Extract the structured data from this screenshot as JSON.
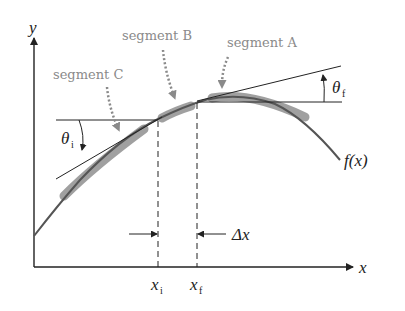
{
  "diagram": {
    "axes": {
      "x_label": "x",
      "y_label": "y"
    },
    "function_label": "f(x)",
    "segments": [
      {
        "id": "A",
        "label": "segment A"
      },
      {
        "id": "B",
        "label": "segment B"
      },
      {
        "id": "C",
        "label": "segment C"
      }
    ],
    "angles": {
      "initial": {
        "symbol": "θ",
        "subscript": "i"
      },
      "final": {
        "symbol": "θ",
        "subscript": "f"
      }
    },
    "x_markers": {
      "initial": {
        "symbol": "x",
        "subscript": "i"
      },
      "final": {
        "symbol": "x",
        "subscript": "f"
      }
    },
    "interval_label": "Δx",
    "colors": {
      "line": "#222222",
      "curve": "#555555",
      "segment_fill": "#9a9a9a",
      "label_gray": "#8a8a8a",
      "pointer_gray": "#8a8a8a"
    }
  }
}
